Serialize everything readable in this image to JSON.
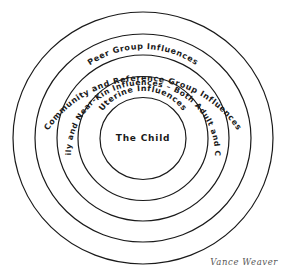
{
  "diagram": {
    "center_label": "The Child",
    "rings": [
      {
        "id": "community",
        "label": "Community and Reference Group Influences"
      },
      {
        "id": "peer",
        "label": "Peer Group Influences"
      },
      {
        "id": "family",
        "label": "Family and Near-Kin Influences – Both Adult and Child"
      },
      {
        "id": "uterine",
        "label": "Uterine Influences"
      }
    ],
    "ring_count": 5,
    "stroke_color": "#1a1a1a",
    "background_color": "#ffffff"
  },
  "signature": "Vance Weaver"
}
